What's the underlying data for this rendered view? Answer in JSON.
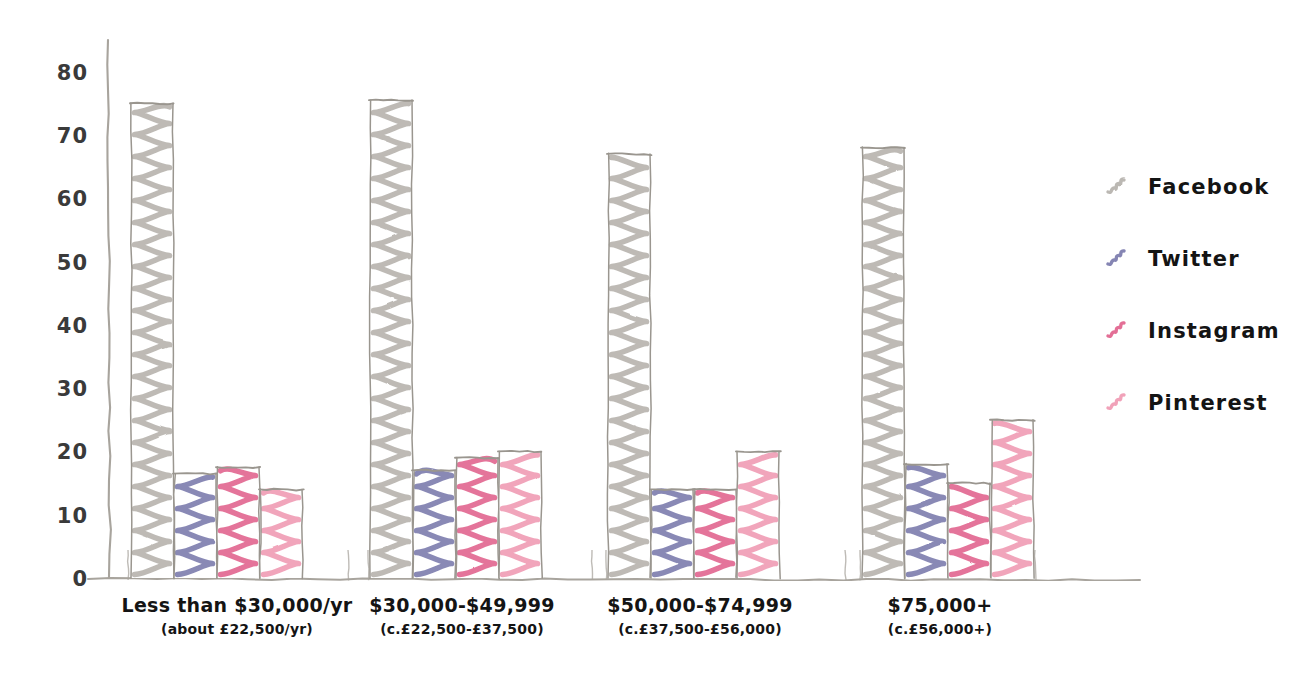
{
  "chart_data": {
    "type": "bar",
    "title": "",
    "xlabel": "",
    "ylabel": "",
    "ylim": [
      0,
      85
    ],
    "yticks": [
      0,
      10,
      20,
      30,
      40,
      50,
      60,
      70,
      80
    ],
    "grid": false,
    "legend_position": "right",
    "style": "hand-drawn-sketch",
    "categories": [
      "Less than $30,000/yr",
      "$30,000-$49,999",
      "$50,000-$74,999",
      "$75,000+"
    ],
    "category_sublabels": [
      "(about £22,500/yr)",
      "(c.£22,500-£37,500)",
      "(c.£37,500-£56,000)",
      "(c.£56,000+)"
    ],
    "series": [
      {
        "name": "Facebook",
        "color": "#b0aca6",
        "values": [
          75,
          75.5,
          67,
          68
        ]
      },
      {
        "name": "Twitter",
        "color": "#6f6fa6",
        "values": [
          16.5,
          17,
          14,
          18
        ]
      },
      {
        "name": "Instagram",
        "color": "#df5784",
        "values": [
          17.5,
          19,
          14,
          15
        ]
      },
      {
        "name": "Pinterest",
        "color": "#ef92ad",
        "values": [
          14,
          20,
          20,
          25
        ]
      }
    ]
  },
  "axis": {
    "tick_labels": [
      "0",
      "10",
      "20",
      "30",
      "40",
      "50",
      "60",
      "70",
      "80"
    ]
  },
  "legend": {
    "items": [
      {
        "label": "Facebook",
        "color": "#b0aca6",
        "marker": "scribble-swatch-icon"
      },
      {
        "label": "Twitter",
        "color": "#6f6fa6",
        "marker": "scribble-swatch-icon"
      },
      {
        "label": "Instagram",
        "color": "#df5784",
        "marker": "scribble-swatch-icon"
      },
      {
        "label": "Pinterest",
        "color": "#ef92ad",
        "marker": "scribble-swatch-icon"
      }
    ]
  },
  "colors": {
    "pencil_outline": "#9a968f",
    "axis": "#a8a49d",
    "background": "#ffffff",
    "text": "#141414"
  }
}
